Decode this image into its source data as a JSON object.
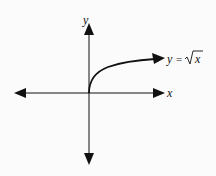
{
  "diagram": {
    "axes": {
      "x_label": "x",
      "y_label": "y",
      "x_arrows": "both",
      "y_arrows": "both"
    },
    "curve": {
      "label_lhs": "y",
      "label_eq": "=",
      "label_rhs": "x",
      "label_full": "y = √x",
      "function": "sqrt(x)",
      "domain": "x ≥ 0",
      "start_point": "origin",
      "end": "arrow"
    },
    "colors": {
      "line": "#111111",
      "background": "#fbfbfb"
    }
  }
}
